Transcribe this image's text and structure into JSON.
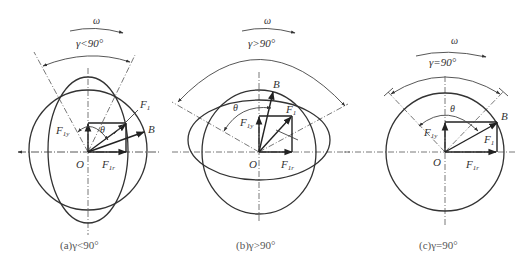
{
  "figure": {
    "panels": [
      {
        "id": "a",
        "omega_label": "ω",
        "gamma_label": "γ<90°",
        "theta_label": "θ",
        "origin_label": "O",
        "point_label": "B",
        "force_labels": {
          "f1": "F",
          "f1_sub": "1",
          "f1y": "F",
          "f1y_sub": "1y",
          "f1r": "F",
          "f1r_sub": "1r"
        },
        "caption": "(a)γ<90°"
      },
      {
        "id": "b",
        "omega_label": "ω",
        "gamma_label": "γ>90°",
        "theta_label": "θ",
        "origin_label": "O",
        "point_label": "B",
        "force_labels": {
          "f1": "F",
          "f1_sub": "1",
          "f1y": "F",
          "f1y_sub": "1y",
          "f1r": "F",
          "f1r_sub": "1r"
        },
        "caption": "(b)γ>90°"
      },
      {
        "id": "c",
        "omega_label": "ω",
        "gamma_label": "γ=90°",
        "theta_label": "θ",
        "origin_label": "O",
        "point_label": "B",
        "force_labels": {
          "f1": "F",
          "f1_sub": "1",
          "f1y": "F",
          "f1y_sub": "1y",
          "f1r": "F",
          "f1r_sub": "1r"
        },
        "caption": "(c)γ=90°"
      }
    ],
    "colors": {
      "line": "#333333",
      "background": "#ffffff"
    }
  }
}
